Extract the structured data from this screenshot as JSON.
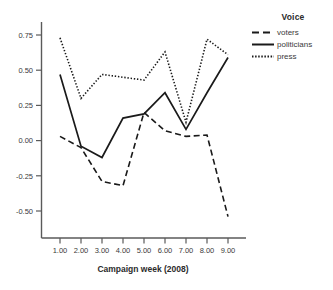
{
  "chart_data": {
    "type": "line",
    "title": "",
    "xlabel": "Campaign week (2008)",
    "ylabel": "",
    "x": [
      1,
      2,
      3,
      4,
      5,
      6,
      7,
      8,
      9
    ],
    "categories": [
      "1.00",
      "2.00",
      "3.00",
      "4.00",
      "5.00",
      "6.00",
      "7.00",
      "8.00",
      "9.00"
    ],
    "xticklabels": [
      "1.00",
      "2.00",
      "3.00",
      "4.00",
      "5.00",
      "6.00",
      "7.00",
      "8.00",
      "9.00"
    ],
    "yticklabels": [
      "0.75",
      "0.50",
      "0.25",
      "0.00",
      "-0.25",
      "-0.50"
    ],
    "ytickvalues": [
      0.75,
      0.5,
      0.25,
      0.0,
      -0.25,
      -0.5
    ],
    "xlim": [
      0.5,
      9.6
    ],
    "ylim": [
      -0.62,
      0.82
    ],
    "grid": false,
    "legend_position": "right",
    "legend_title": "Voice",
    "series": [
      {
        "name": "voters",
        "style": "dashed",
        "color": "#1a1a1a",
        "values": [
          0.03,
          -0.05,
          -0.29,
          -0.32,
          0.2,
          0.07,
          0.03,
          0.04,
          -0.54
        ]
      },
      {
        "name": "politicians",
        "style": "solid",
        "color": "#1a1a1a",
        "values": [
          0.47,
          -0.04,
          -0.12,
          0.16,
          0.19,
          0.34,
          0.08,
          0.34,
          0.59
        ]
      },
      {
        "name": "press",
        "style": "dotted",
        "color": "#1a1a1a",
        "values": [
          0.73,
          0.3,
          0.47,
          0.45,
          0.43,
          0.63,
          0.13,
          0.72,
          0.61
        ]
      }
    ]
  },
  "legend": {
    "title": "Voice",
    "items": [
      {
        "label": "voters",
        "style": "dashed"
      },
      {
        "label": "politicians",
        "style": "solid"
      },
      {
        "label": "press",
        "style": "dotted"
      }
    ]
  },
  "axes": {
    "x_title": "Campaign week (2008)",
    "x_ticks": [
      "1.00",
      "2.00",
      "3.00",
      "4.00",
      "5.00",
      "6.00",
      "7.00",
      "8.00",
      "9.00"
    ],
    "y_ticks": [
      "0.75",
      "0.50",
      "0.25",
      "0.00",
      "-0.25",
      "-0.50"
    ]
  },
  "colors": {
    "line": "#1a1a1a",
    "axis": "#5a5a5a",
    "text": "#3a3a3a",
    "background": "#ffffff"
  }
}
